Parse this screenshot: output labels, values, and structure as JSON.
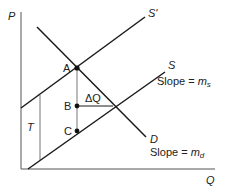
{
  "diagram": {
    "axes": {
      "y_label": "P",
      "x_label": "Q"
    },
    "curves": {
      "supply_shifted": {
        "label": "S'"
      },
      "supply": {
        "label": "S",
        "slope_text": "Slope = ",
        "slope_var": "m",
        "slope_sub": "s"
      },
      "demand": {
        "label": "D",
        "slope_text": "Slope = ",
        "slope_var": "m",
        "slope_sub": "d"
      }
    },
    "points": {
      "a": "A",
      "b": "B",
      "c": "C"
    },
    "annotations": {
      "tax": "T",
      "delta_q": "ΔQ"
    },
    "colors": {
      "line": "#1a1a1a",
      "axis": "#555555",
      "guide": "#777777"
    }
  }
}
